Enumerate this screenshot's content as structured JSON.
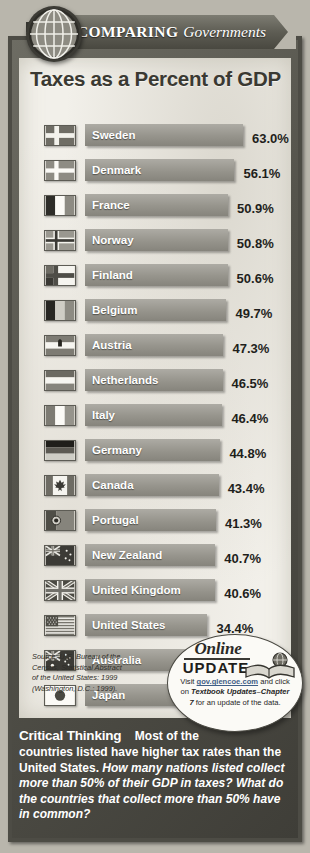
{
  "banner": {
    "word1": "COMPARING",
    "word2": "Governments",
    "globe_icon": "globe-icon"
  },
  "title": "Taxes as a Percent of GDP",
  "chart_data": {
    "type": "bar",
    "title": "Taxes as a Percent of GDP",
    "xlabel": "",
    "ylabel": "",
    "xlim": [
      0,
      63.0
    ],
    "grid": false,
    "legend": "none",
    "value_suffix": "%",
    "categories": [
      "Sweden",
      "Denmark",
      "France",
      "Norway",
      "Finland",
      "Belgium",
      "Austria",
      "Netherlands",
      "Italy",
      "Germany",
      "Canada",
      "Portugal",
      "New Zealand",
      "United Kingdom",
      "United States",
      "Australia",
      "Japan"
    ],
    "values": [
      63.0,
      56.1,
      50.9,
      50.8,
      50.6,
      49.7,
      47.3,
      46.5,
      46.4,
      44.8,
      43.4,
      41.3,
      40.7,
      40.6,
      34.4,
      33.4,
      30.8
    ],
    "value_labels": [
      "63.0%",
      "56.1%",
      "50.9%",
      "50.8%",
      "50.6%",
      "49.7%",
      "47.3%",
      "46.5%",
      "46.4%",
      "44.8%",
      "43.4%",
      "41.3%",
      "40.7%",
      "40.6%",
      "34.4%",
      "33.4%",
      "30.8%"
    ],
    "rows": [
      {
        "country": "Sweden",
        "value": 63.0,
        "label": "63.0%",
        "flag": "flag-sweden"
      },
      {
        "country": "Denmark",
        "value": 56.1,
        "label": "56.1%",
        "flag": "flag-denmark"
      },
      {
        "country": "France",
        "value": 50.9,
        "label": "50.9%",
        "flag": "flag-france"
      },
      {
        "country": "Norway",
        "value": 50.8,
        "label": "50.8%",
        "flag": "flag-norway"
      },
      {
        "country": "Finland",
        "value": 50.6,
        "label": "50.6%",
        "flag": "flag-finland"
      },
      {
        "country": "Belgium",
        "value": 49.7,
        "label": "49.7%",
        "flag": "flag-belgium"
      },
      {
        "country": "Austria",
        "value": 47.3,
        "label": "47.3%",
        "flag": "flag-austria"
      },
      {
        "country": "Netherlands",
        "value": 46.5,
        "label": "46.5%",
        "flag": "flag-netherlands"
      },
      {
        "country": "Italy",
        "value": 46.4,
        "label": "46.4%",
        "flag": "flag-italy"
      },
      {
        "country": "Germany",
        "value": 44.8,
        "label": "44.8%",
        "flag": "flag-germany"
      },
      {
        "country": "Canada",
        "value": 43.4,
        "label": "43.4%",
        "flag": "flag-canada"
      },
      {
        "country": "Portugal",
        "value": 41.3,
        "label": "41.3%",
        "flag": "flag-portugal"
      },
      {
        "country": "New Zealand",
        "value": 40.7,
        "label": "40.7%",
        "flag": "flag-new-zealand"
      },
      {
        "country": "United Kingdom",
        "value": 40.6,
        "label": "40.6%",
        "flag": "flag-united-kingdom"
      },
      {
        "country": "United States",
        "value": 34.4,
        "label": "34.4%",
        "flag": "flag-united-states"
      },
      {
        "country": "Australia",
        "value": 33.4,
        "label": "33.4%",
        "flag": "flag-australia"
      },
      {
        "country": "Japan",
        "value": 30.8,
        "label": "30.8%",
        "flag": "flag-japan"
      }
    ]
  },
  "source": {
    "line1": "Source: U.S. Bureau of the",
    "line2": "Census, Statistical Abstract",
    "line3": "of the United States: 1999",
    "line4": "(Washington, D.C.: 1999)."
  },
  "badge": {
    "online": "Online",
    "update": "UPDATE",
    "visit": "Visit",
    "link": "gov.glencoe.com",
    "and_click": "and click on",
    "emphasis": "Textbook Updates–Chapter 7",
    "tail": "for an update of the data.",
    "book_icon": "book-globe-icon"
  },
  "critical_thinking": {
    "heading": "Critical Thinking",
    "lead": "Most of the",
    "body": "countries listed have higher tax rates than the United States.",
    "question": "How many nations listed collect more than 50% of their GDP in taxes? What do the countries that collect more than 50% have in common?"
  },
  "colors": {
    "frame": "#4d4c45",
    "panel": "#f2f0ea",
    "bar": "#96948c",
    "text_dark": "#1f1f1c",
    "link": "#3f5f86"
  }
}
